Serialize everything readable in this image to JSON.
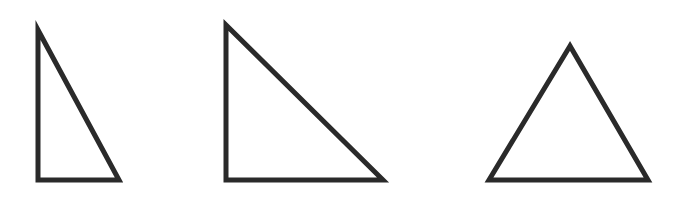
{
  "figure": {
    "background_color": "#ffffff",
    "stroke_color": "#2a2a2a",
    "stroke_width": 5,
    "canvas": {
      "width": 691,
      "height": 203
    },
    "shape_count": 3,
    "shapes": [
      {
        "name": "triangle-right-narrow",
        "label": "Right triangle (tall, narrow)",
        "type": "triangle",
        "classification": "right scalene",
        "right_angle_vertex": "bottom-left",
        "points": "38,30 38,180 119,180",
        "vertices": [
          {
            "name": "apex",
            "x": 38,
            "y": 30
          },
          {
            "name": "bottom-left",
            "x": 38,
            "y": 180
          },
          {
            "name": "bottom-right",
            "x": 119,
            "y": 180
          }
        ],
        "base_width": 81,
        "height": 150
      },
      {
        "name": "triangle-right-large",
        "label": "Right triangle (large, 45-45-90)",
        "type": "triangle",
        "classification": "right isosceles",
        "right_angle_vertex": "bottom-left",
        "points": "226,25 226,180 383,180",
        "vertices": [
          {
            "name": "apex",
            "x": 226,
            "y": 25
          },
          {
            "name": "bottom-left",
            "x": 226,
            "y": 180
          },
          {
            "name": "bottom-right",
            "x": 383,
            "y": 180
          }
        ],
        "base_width": 157,
        "height": 155
      },
      {
        "name": "triangle-isosceles-acute",
        "label": "Isosceles triangle (acute, apex up)",
        "type": "triangle",
        "classification": "acute isosceles",
        "right_angle_vertex": "none",
        "points": "570,46 489,180 648,180",
        "vertices": [
          {
            "name": "apex",
            "x": 570,
            "y": 46
          },
          {
            "name": "bottom-left",
            "x": 489,
            "y": 180
          },
          {
            "name": "bottom-right",
            "x": 648,
            "y": 180
          }
        ],
        "base_width": 159,
        "height": 134
      }
    ]
  }
}
